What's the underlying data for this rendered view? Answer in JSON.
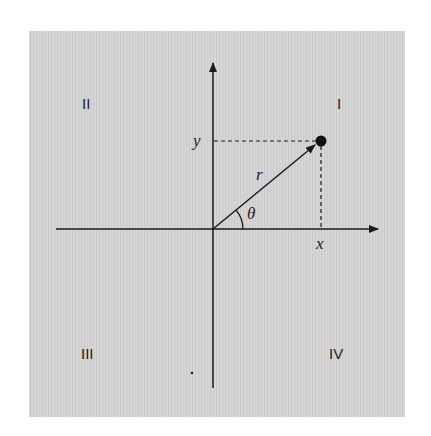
{
  "diagram": {
    "type": "polar-coordinates",
    "background_color": "#d3d3d3",
    "ink_color": "#1a1a1a",
    "quadrants": {
      "I": "I",
      "II": "II",
      "III": "III",
      "IV": "IV"
    },
    "labels": {
      "x": "x",
      "y": "y",
      "r": "r",
      "theta": "θ"
    }
  }
}
